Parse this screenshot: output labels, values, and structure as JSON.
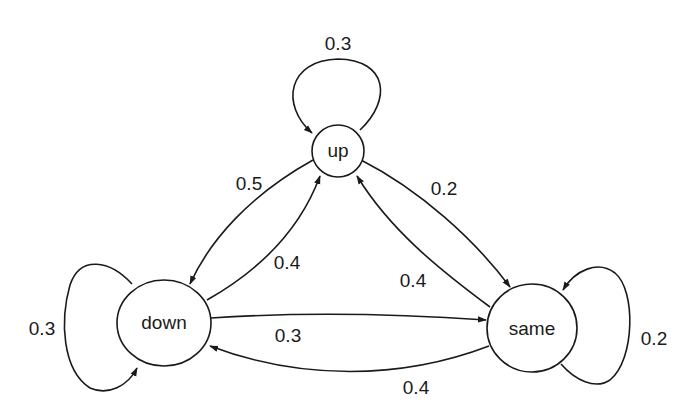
{
  "diagram": {
    "type": "markov_chain_state_transition",
    "nodes": [
      {
        "id": "up",
        "label": "up"
      },
      {
        "id": "down",
        "label": "down"
      },
      {
        "id": "same",
        "label": "same"
      }
    ],
    "edges": [
      {
        "from": "up",
        "to": "up",
        "label": "0.3"
      },
      {
        "from": "up",
        "to": "down",
        "label": "0.5"
      },
      {
        "from": "up",
        "to": "same",
        "label": "0.2"
      },
      {
        "from": "down",
        "to": "up",
        "label": "0.4"
      },
      {
        "from": "down",
        "to": "down",
        "label": "0.3"
      },
      {
        "from": "down",
        "to": "same",
        "label": "0.3"
      },
      {
        "from": "same",
        "to": "up",
        "label": "0.4"
      },
      {
        "from": "same",
        "to": "down",
        "label": "0.4"
      },
      {
        "from": "same",
        "to": "same",
        "label": "0.2"
      }
    ]
  }
}
